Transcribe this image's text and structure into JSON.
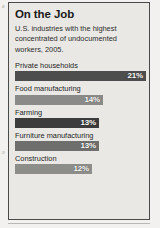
{
  "margin": {
    "folio_top": "8",
    "folio_mid": "9"
  },
  "infographic": {
    "title": "On the Job",
    "subtitle": "U.S. industries with the highest concentrated of undocumented workers, 2005."
  },
  "chart_data": {
    "type": "bar",
    "orientation": "horizontal",
    "title": "On the Job",
    "subtitle": "U.S. industries with the highest concentrated of undocumented workers, 2005.",
    "xlabel": "",
    "ylabel": "",
    "unit": "%",
    "grid": false,
    "legend": false,
    "categories": [
      "Private households",
      "Food manufacturing",
      "Farming",
      "Furniture manufacturing",
      "Construction"
    ],
    "values": [
      21,
      14,
      13,
      13,
      12
    ],
    "value_labels": [
      "21%",
      "14%",
      "13%",
      "13%",
      "12%"
    ],
    "bar_pixel_widths": [
      131,
      88,
      84,
      84,
      77
    ],
    "bar_colors": [
      "#4d4d4d",
      "#8a8a88",
      "#3c3c3c",
      "#6e6e6c",
      "#8d8d8a"
    ],
    "xlim": [
      0,
      21
    ]
  },
  "colors": {
    "frame_border": "#4a4a48",
    "panel_background": "#e9e8e4",
    "page_background": "#f2f1ef",
    "text": "#1b1b1b",
    "value_text": "#ffffff"
  }
}
